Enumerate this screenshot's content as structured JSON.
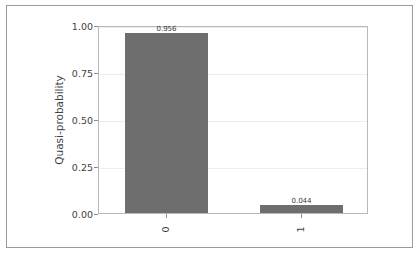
{
  "chart_data": {
    "type": "bar",
    "title": "",
    "subtitle": "",
    "xlabel": "",
    "ylabel": "Quasi-probability",
    "categories": [
      "0",
      "1"
    ],
    "values": [
      0.956,
      0.044
    ],
    "value_labels": [
      "0.956",
      "0.044"
    ],
    "series": [
      {
        "name": "Quasi-probability",
        "values": [
          0.956,
          0.044
        ],
        "color": "#6e6e6e"
      }
    ],
    "ylim": [
      0.0,
      1.0
    ],
    "y_ticks": [
      0.0,
      0.25,
      0.5,
      0.75,
      1.0
    ],
    "y_tick_labels": [
      "0.00",
      "0.25",
      "0.50",
      "0.75",
      "1.00"
    ],
    "x_tick_labels": [
      "0",
      "1"
    ],
    "x_tick_label_rotation": -90,
    "grid": true,
    "grid_axis": "y",
    "legend": false,
    "legend_position": "none",
    "bar_color": "#6e6e6e",
    "grid_color": "#ededef",
    "axis_color": "#b9b9bd",
    "text_color": "#3f3f3f",
    "background_color": "#ffffff",
    "frame_color": "#9a9a9e"
  },
  "figure": {
    "y_axis_label": "Quasi-probability",
    "y_tick_labels": [
      "1.00",
      "0.75",
      "0.50",
      "0.25",
      "0.00"
    ],
    "bars": [
      {
        "category": "0",
        "value_label": "0.956"
      },
      {
        "category": "1",
        "value_label": "0.044"
      }
    ]
  }
}
